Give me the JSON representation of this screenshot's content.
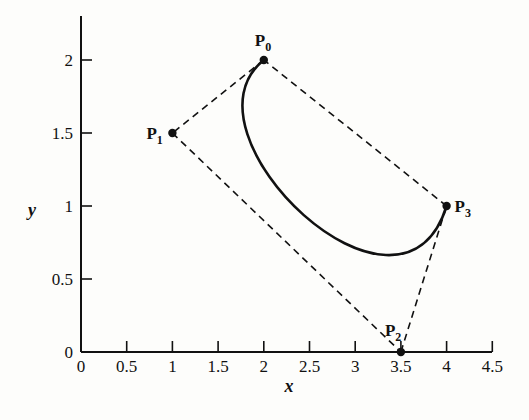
{
  "chart_data": {
    "type": "line",
    "title": "",
    "xlabel": "x",
    "ylabel": "y",
    "xlim": [
      0,
      4.5
    ],
    "ylim": [
      0,
      2.25
    ],
    "grid": false,
    "legend": null,
    "x_ticks": [
      0,
      0.5,
      1,
      1.5,
      2,
      2.5,
      3,
      3.5,
      4,
      4.5
    ],
    "x_tick_labels": [
      "0",
      "0.5",
      "1",
      "1.5",
      "2",
      "2.5",
      "3",
      "3.5",
      "4",
      "4.5"
    ],
    "y_ticks": [
      0,
      0.5,
      1,
      1.5,
      2
    ],
    "y_tick_labels": [
      "0",
      "0.5",
      "1",
      "1.5",
      "2"
    ],
    "control_points": [
      {
        "name": "P",
        "sub": "0",
        "x": 2,
        "y": 2,
        "label_pos": "above"
      },
      {
        "name": "P",
        "sub": "1",
        "x": 1,
        "y": 1.5,
        "label_pos": "left"
      },
      {
        "name": "P",
        "sub": "2",
        "x": 3.5,
        "y": 0,
        "label_pos": "above-left"
      },
      {
        "name": "P",
        "sub": "3",
        "x": 4,
        "y": 1,
        "label_pos": "right"
      }
    ],
    "control_polygon": {
      "style": "dashed",
      "segments": [
        [
          [
            2,
            2
          ],
          [
            1,
            1.5
          ]
        ],
        [
          [
            1,
            1.5
          ],
          [
            3.5,
            0
          ]
        ],
        [
          [
            3.5,
            0
          ],
          [
            4,
            1
          ]
        ],
        [
          [
            4,
            1
          ],
          [
            2,
            2
          ]
        ]
      ]
    },
    "series": [
      {
        "name": "Bezier curve",
        "style": "solid",
        "x": [
          2.0,
          1.8,
          1.74,
          1.79,
          1.93,
          2.13,
          2.38,
          2.66,
          2.95,
          3.23,
          3.48,
          3.69,
          3.84,
          3.94,
          3.99,
          4.0
        ],
        "y": [
          2.0,
          1.74,
          1.51,
          1.31,
          1.14,
          1.0,
          0.88,
          0.79,
          0.72,
          0.68,
          0.67,
          0.68,
          0.73,
          0.8,
          0.89,
          1.0
        ]
      }
    ]
  }
}
